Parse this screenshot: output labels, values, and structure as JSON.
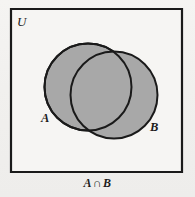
{
  "figure": {
    "kind": "venn-diagram",
    "width": 195,
    "height": 197,
    "background_color": "#f2f1ef",
    "universe_label": "U",
    "caption_left_operand": "A",
    "caption_operator": "∩",
    "caption_right_operand": "B",
    "caption_full": "A ∩ B"
  },
  "universe_rect": {
    "label": "U",
    "x": 11,
    "y": 9,
    "width": 171,
    "height": 163,
    "stroke_color": "#1a1a1a",
    "stroke_width": 2.2,
    "fill_color": "#f6f5f3"
  },
  "sets": [
    {
      "name": "A",
      "label": "A",
      "cx": 88,
      "cy": 87,
      "r": 43.5,
      "fill_color": "#a8a8a8",
      "stroke_color": "#1a1a1a",
      "stroke_width": 2.0,
      "label_x": 41,
      "label_y": 112
    },
    {
      "name": "B",
      "label": "B",
      "cx": 114,
      "cy": 95,
      "r": 43.5,
      "fill_color": "#a8a8a8",
      "stroke_color": "#1a1a1a",
      "stroke_width": 2.0,
      "label_x": 150,
      "label_y": 121
    }
  ],
  "shaded_region": {
    "description": "intersection",
    "fill_color": "#a8a8a8",
    "shaded": true
  },
  "colors": {
    "ink": "#1a1a1a",
    "set_fill": "#a8a8a8",
    "paper": "#f2f1ef"
  }
}
